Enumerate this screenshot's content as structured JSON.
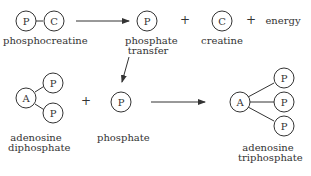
{
  "diagram": {
    "row1": {
      "reactant": {
        "circles": [
          "P",
          "C"
        ],
        "label": "phosphocreatine"
      },
      "products": [
        {
          "circle": "P",
          "label_lines": [
            "phosphate",
            "transfer"
          ]
        },
        {
          "operator": "+"
        },
        {
          "circle": "C",
          "label": "creatine"
        },
        {
          "operator": "+"
        },
        {
          "text": "energy"
        }
      ]
    },
    "row2": {
      "reactants": [
        {
          "circles": [
            "A",
            "P",
            "P"
          ],
          "label_lines": [
            "adenosine",
            "diphosphate"
          ]
        },
        {
          "operator": "+"
        },
        {
          "circle": "P",
          "label": "phosphate"
        }
      ],
      "product": {
        "circles": [
          "A",
          "P",
          "P",
          "P"
        ],
        "label_lines": [
          "adenosine",
          "triphosphate"
        ]
      }
    },
    "symbols": {
      "P": "P",
      "C": "C",
      "A": "A",
      "plus": "+"
    },
    "labels": {
      "phosphocreatine": "phosphocreatine",
      "phosphate_transfer_1": "phosphate",
      "phosphate_transfer_2": "transfer",
      "creatine": "creatine",
      "energy": "energy",
      "adp_1": "adenosine",
      "adp_2": "diphosphate",
      "phosphate": "phosphate",
      "atp_1": "adenosine",
      "atp_2": "triphosphate"
    },
    "colors": {
      "stroke": "#333333",
      "background": "#ffffff"
    }
  }
}
